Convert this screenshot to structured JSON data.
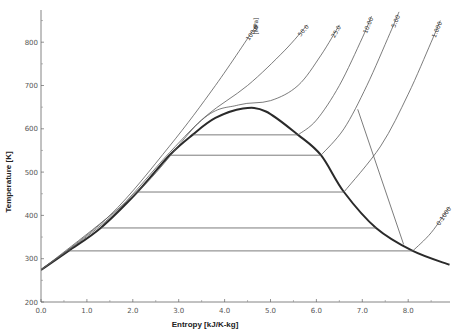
{
  "chart_data": {
    "type": "line",
    "title": "",
    "xlabel": "Entropy [kJ/K-kg]",
    "ylabel": "Temperature [K]",
    "xlim": [
      0.0,
      8.9
    ],
    "ylim": [
      200,
      880
    ],
    "grid": false,
    "x_ticks": [
      "0.0",
      "1.0",
      "2.0",
      "3.0",
      "4.0",
      "5.0",
      "6.0",
      "7.0",
      "8.0"
    ],
    "y_ticks": [
      "200",
      "300",
      "400",
      "500",
      "600",
      "700",
      "800"
    ],
    "pressure_unit_label": "[MPa]",
    "series": [
      {
        "name": "Saturation dome",
        "style": "thick",
        "points": [
          [
            0.0,
            274
          ],
          [
            0.6,
            318
          ],
          [
            1.3,
            371
          ],
          [
            2.1,
            454
          ],
          [
            2.8,
            539
          ],
          [
            3.3,
            586
          ],
          [
            3.8,
            625
          ],
          [
            4.4,
            647
          ],
          [
            4.9,
            640
          ],
          [
            5.6,
            586
          ],
          [
            6.1,
            539
          ],
          [
            6.6,
            454
          ],
          [
            7.3,
            371
          ],
          [
            8.1,
            318
          ],
          [
            8.9,
            286
          ]
        ]
      },
      {
        "name": "Isotherm 318 K",
        "points": [
          [
            0.6,
            318
          ],
          [
            8.1,
            318
          ]
        ]
      },
      {
        "name": "Isotherm 371 K",
        "points": [
          [
            1.3,
            371
          ],
          [
            7.3,
            371
          ]
        ]
      },
      {
        "name": "Isotherm 454 K",
        "points": [
          [
            2.1,
            454
          ],
          [
            6.6,
            454
          ]
        ]
      },
      {
        "name": "Isotherm 539 K",
        "points": [
          [
            2.8,
            539
          ],
          [
            6.1,
            539
          ]
        ]
      },
      {
        "name": "Isotherm 586 K",
        "points": [
          [
            3.3,
            586
          ],
          [
            5.6,
            586
          ]
        ]
      },
      {
        "name": "Isobar 100.0 MPa",
        "label": "100.0",
        "points": [
          [
            0.0,
            274
          ],
          [
            1.5,
            400
          ],
          [
            2.8,
            560
          ],
          [
            3.8,
            700
          ],
          [
            4.7,
            840
          ]
        ]
      },
      {
        "name": "Isobar 50.0 MPa",
        "label": "50.0",
        "points": [
          [
            0.0,
            274
          ],
          [
            1.5,
            395
          ],
          [
            2.8,
            545
          ],
          [
            3.6,
            630
          ],
          [
            4.5,
            700
          ],
          [
            5.3,
            780
          ],
          [
            5.8,
            840
          ]
        ]
      },
      {
        "name": "Isobar 25.0 MPa",
        "label": "25.0",
        "points": [
          [
            0.0,
            274
          ],
          [
            2.1,
            454
          ],
          [
            3.5,
            620
          ],
          [
            4.3,
            655
          ],
          [
            5.0,
            665
          ],
          [
            5.6,
            700
          ],
          [
            6.1,
            770
          ],
          [
            6.5,
            840
          ]
        ]
      },
      {
        "name": "Isobar 10.00 MPa",
        "label": "10.00",
        "points": [
          [
            5.6,
            586
          ],
          [
            6.0,
            620
          ],
          [
            6.5,
            700
          ],
          [
            7.0,
            810
          ],
          [
            7.2,
            860
          ]
        ]
      },
      {
        "name": "Isobar 5.00 MPa",
        "label": "5.00",
        "points": [
          [
            6.1,
            539
          ],
          [
            6.6,
            600
          ],
          [
            7.1,
            700
          ],
          [
            7.6,
            820
          ],
          [
            7.8,
            870
          ]
        ]
      },
      {
        "name": "Isobar 1.000 MPa",
        "label": "1.000",
        "points": [
          [
            6.6,
            454
          ],
          [
            7.4,
            560
          ],
          [
            8.0,
            680
          ],
          [
            8.5,
            800
          ],
          [
            8.7,
            850
          ]
        ]
      },
      {
        "name": "Isobar 0.1000 MPa",
        "label": "0.1000",
        "points": [
          [
            8.1,
            318
          ],
          [
            8.5,
            360
          ],
          [
            8.9,
            420
          ]
        ]
      },
      {
        "name": "Isenthalpic line",
        "points": [
          [
            6.9,
            645
          ],
          [
            7.9,
            333
          ]
        ]
      }
    ]
  }
}
